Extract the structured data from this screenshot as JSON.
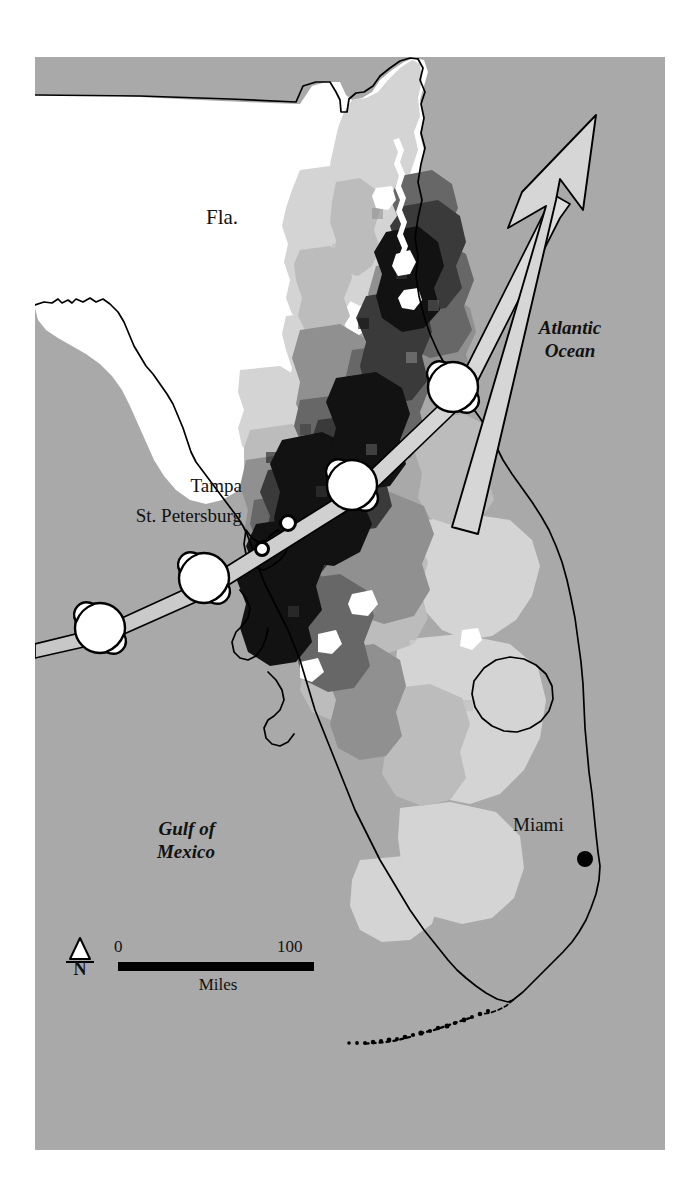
{
  "figure": {
    "kind": "thematic-map",
    "width": 697,
    "height": 1195
  },
  "colors": {
    "paper": "#ffffff",
    "ocean": "#a9a9a9",
    "land_none": "#ffffff",
    "land_very_light": "#d8d8d8",
    "land_light": "#bdbdbd",
    "land_medium": "#949494",
    "land_dark": "#6b6b6b",
    "land_very_dark": "#3d3d3d",
    "land_darkest": "#141414",
    "outline": "#000000",
    "track_fill": "#cfcfcf",
    "symbol_fill": "#ffffff",
    "city_dot": "#000000"
  },
  "labels": {
    "state": "Fla.",
    "atlantic": "Atlantic\nOcean",
    "atlantic_line1": "Atlantic",
    "atlantic_line2": "Ocean",
    "gulf_line1": "Gulf of",
    "gulf_line2": "Mexico",
    "city_tampa": "Tampa",
    "city_st_petersburg": "St. Petersburg",
    "city_miami": "Miami"
  },
  "scale_bar": {
    "min_label": "0",
    "max_label": "100",
    "unit_label": "Miles",
    "north_label": "N"
  },
  "icons": {
    "north_arrow": "north-arrow-icon",
    "hurricane": "hurricane-icon",
    "direction_arrow": "direction-arrow-icon",
    "city_marker": "city-marker-icon"
  },
  "hurricane_positions": [
    {
      "id": 1,
      "cx": 100,
      "cy": 628,
      "r": 26,
      "note": "offshore Gulf of Mexico, southwest approach"
    },
    {
      "id": 2,
      "cx": 204,
      "cy": 578,
      "r": 26,
      "note": "approaching Tampa Bay coast"
    },
    {
      "id": 3,
      "cx": 352,
      "cy": 485,
      "r": 26,
      "note": "inland central peninsula"
    },
    {
      "id": 4,
      "cx": 453,
      "cy": 387,
      "r": 26,
      "note": "northeast, nearing Atlantic coast"
    }
  ],
  "city_markers": [
    {
      "name": "St. Petersburg",
      "cx": 262,
      "cy": 549,
      "r": 7
    },
    {
      "name": "Tampa",
      "cx": 288,
      "cy": 523,
      "r": 8
    },
    {
      "name": "Miami",
      "cx": 585,
      "cy": 859,
      "r": 7
    }
  ],
  "track": {
    "description": "Storm track band running southwest to northeast across the peninsula, ending in an arrowhead over the Atlantic Ocean",
    "start": {
      "x": 35,
      "y": 638
    },
    "end": {
      "x": 596,
      "y": 115
    }
  }
}
